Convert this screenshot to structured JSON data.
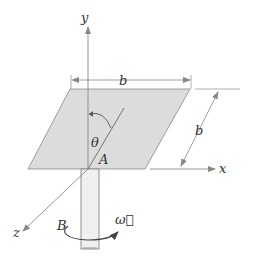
{
  "diagram": {
    "type": "mechanics-figure",
    "labels": {
      "y_axis": "y",
      "x_axis": "x",
      "z_axis": "z",
      "top_dimension": "b",
      "side_dimension": "b",
      "angle": "θ",
      "point_a": "A",
      "point_b": "B",
      "omega": "ω⃗"
    },
    "colors": {
      "plate_fill": "#d9d9d9",
      "shaft_fill": "#eeeeee",
      "line": "#555555",
      "axis": "#8a8a8a"
    }
  }
}
